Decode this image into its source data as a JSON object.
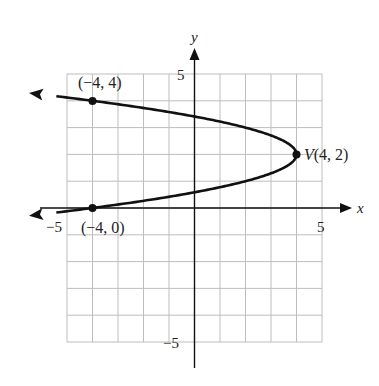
{
  "chart_data": {
    "type": "line",
    "title": "",
    "xlabel": "x",
    "ylabel": "y",
    "xlim": [
      -5,
      5
    ],
    "ylim": [
      -5,
      5
    ],
    "grid": true,
    "tick_labels": {
      "x": [
        {
          "value": -5,
          "label": "−5"
        },
        {
          "value": 5,
          "label": "5"
        }
      ],
      "y": [
        {
          "value": 5,
          "label": "5"
        },
        {
          "value": -5,
          "label": "−5"
        }
      ]
    },
    "curve": {
      "equation": "x = -2(y - 2)^2 + 4",
      "description": "Parabola opening left with vertex (4, 2)",
      "arrows_at_ends": true
    },
    "points": [
      {
        "x": -4,
        "y": 4,
        "label": "(−4, 4)"
      },
      {
        "x": -4,
        "y": 0,
        "label": "(−4, 0)"
      },
      {
        "x": 4,
        "y": 2,
        "label": "V(4, 2)"
      }
    ]
  },
  "labels": {
    "x_axis": "x",
    "y_axis": "y",
    "x_tick_neg": "−5",
    "x_tick_pos": "5",
    "y_tick_pos": "5",
    "y_tick_neg": "−5",
    "point_top": "(−4, 4)",
    "point_bottom": "(−4, 0)",
    "vertex": "V(4, 2)"
  }
}
